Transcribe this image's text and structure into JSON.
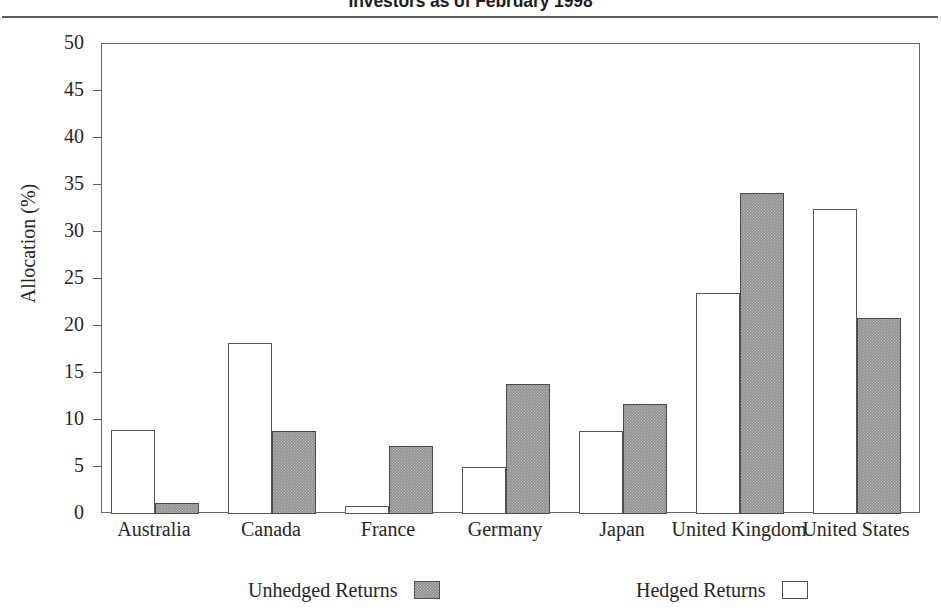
{
  "header": {
    "title": "Investors as of February 1998"
  },
  "legend": {
    "position": "bottom",
    "items": [
      {
        "label": "Unhedged Returns",
        "swatch": "gray-filled-square-swatch"
      },
      {
        "label": "Hedged Returns",
        "swatch": "white-open-square-swatch"
      }
    ]
  },
  "chart_data": {
    "type": "bar",
    "title": "Investors as of February 1998",
    "xlabel": "",
    "ylabel": "Allocation (%)",
    "ylim": [
      0,
      50
    ],
    "ytick_step": 5,
    "yticks": [
      0,
      5,
      10,
      15,
      20,
      25,
      30,
      35,
      40,
      45,
      50
    ],
    "ytick_labels": [
      "0",
      "5",
      "10",
      "15",
      "20",
      "25",
      "30",
      "35",
      "40",
      "45",
      "50"
    ],
    "grid": false,
    "categories": [
      "Australia",
      "Canada",
      "France",
      "Germany",
      "Japan",
      "United Kingdom",
      "United States"
    ],
    "series": [
      {
        "name": "Hedged Returns",
        "style": "white-open",
        "values": [
          8.9,
          18.2,
          0.8,
          5.0,
          8.8,
          23.5,
          32.5
        ]
      },
      {
        "name": "Unhedged Returns",
        "style": "gray-filled",
        "values": [
          1.2,
          8.8,
          7.2,
          13.8,
          11.7,
          34.2,
          20.9
        ]
      }
    ]
  }
}
